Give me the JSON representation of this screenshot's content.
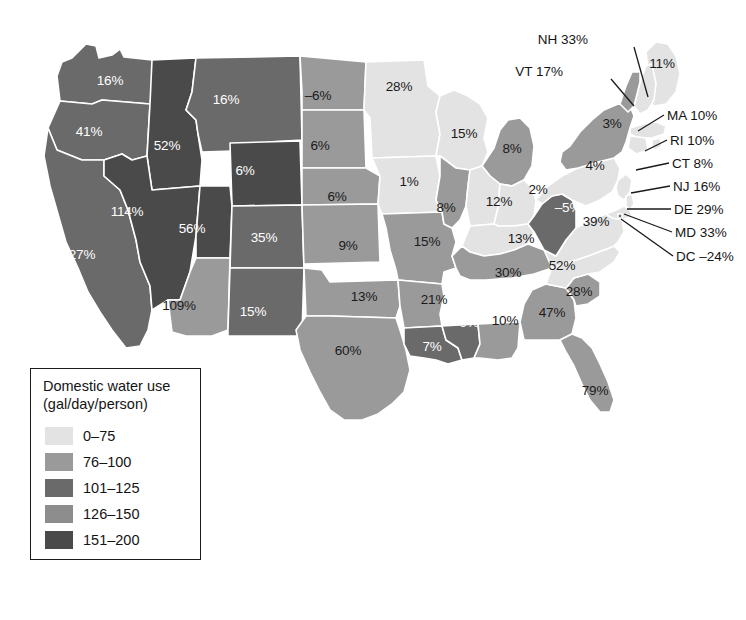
{
  "figure": {
    "type": "choropleth-map",
    "region": "United States (48 contiguous states + DC)",
    "value_suffix": "%"
  },
  "legend": {
    "title_line1": "Domestic water use",
    "title_line2": "(gal/day/person)",
    "classes": [
      {
        "label": "0–75",
        "color": "#e3e3e3"
      },
      {
        "label": "76–100",
        "color": "#9a9a9a"
      },
      {
        "label": "101–125",
        "color": "#6a6a6a"
      },
      {
        "label": "126–150",
        "color": "#8d8d8d"
      },
      {
        "label": "151–200",
        "color": "#4a4a4a"
      }
    ]
  },
  "map": {
    "ocean_color": "#ffffff",
    "border_color": "#ffffff",
    "outline_color": "#b0b0b0",
    "states": [
      {
        "code": "WA",
        "value": "16%",
        "x": 110,
        "y": 80,
        "tone": "light"
      },
      {
        "code": "OR",
        "value": "41%",
        "x": 89,
        "y": 131,
        "tone": "light"
      },
      {
        "code": "CA",
        "value": "27%",
        "x": 82,
        "y": 254,
        "tone": "light"
      },
      {
        "code": "ID",
        "value": "52%",
        "x": 167,
        "y": 145,
        "tone": "light"
      },
      {
        "code": "NV",
        "value": "114%",
        "x": 127,
        "y": 211,
        "tone": "light"
      },
      {
        "code": "MT",
        "value": "16%",
        "x": 226,
        "y": 99,
        "tone": "light"
      },
      {
        "code": "WY",
        "value": "6%",
        "x": 245,
        "y": 170,
        "tone": "light"
      },
      {
        "code": "UT",
        "value": "56%",
        "x": 192,
        "y": 228,
        "tone": "light"
      },
      {
        "code": "CO",
        "value": "35%",
        "x": 264,
        "y": 237,
        "tone": "light"
      },
      {
        "code": "AZ",
        "value": "109%",
        "x": 179,
        "y": 305,
        "tone": "dark"
      },
      {
        "code": "NM",
        "value": "15%",
        "x": 253,
        "y": 311,
        "tone": "light"
      },
      {
        "code": "ND",
        "value": "–6%",
        "x": 318,
        "y": 95,
        "tone": "dark"
      },
      {
        "code": "SD",
        "value": "6%",
        "x": 320,
        "y": 145,
        "tone": "dark"
      },
      {
        "code": "NE",
        "value": "6%",
        "x": 337,
        "y": 196,
        "tone": "dark"
      },
      {
        "code": "KS",
        "value": "9%",
        "x": 348,
        "y": 245,
        "tone": "dark"
      },
      {
        "code": "OK",
        "value": "13%",
        "x": 364,
        "y": 296,
        "tone": "dark"
      },
      {
        "code": "TX",
        "value": "60%",
        "x": 348,
        "y": 350,
        "tone": "dark"
      },
      {
        "code": "MN",
        "value": "28%",
        "x": 399,
        "y": 86,
        "tone": "dark"
      },
      {
        "code": "IA",
        "value": "1%",
        "x": 409,
        "y": 181,
        "tone": "dark"
      },
      {
        "code": "MO",
        "value": "15%",
        "x": 427,
        "y": 241,
        "tone": "dark"
      },
      {
        "code": "AR",
        "value": "21%",
        "x": 434,
        "y": 299,
        "tone": "dark"
      },
      {
        "code": "LA",
        "value": "7%",
        "x": 432,
        "y": 346,
        "tone": "light"
      },
      {
        "code": "WI",
        "value": "15%",
        "x": 464,
        "y": 133,
        "tone": "dark"
      },
      {
        "code": "IL",
        "value": "8%",
        "x": 446,
        "y": 207,
        "tone": "dark"
      },
      {
        "code": "MS",
        "value": "9%",
        "x": 469,
        "y": 322,
        "tone": "light"
      },
      {
        "code": "AL",
        "value": "10%",
        "x": 505,
        "y": 320,
        "tone": "dark"
      },
      {
        "code": "MI",
        "value": "8%",
        "x": 512,
        "y": 148,
        "tone": "dark"
      },
      {
        "code": "IN",
        "value": "12%",
        "x": 499,
        "y": 201,
        "tone": "dark"
      },
      {
        "code": "OH",
        "value": "2%",
        "x": 538,
        "y": 189,
        "tone": "dark"
      },
      {
        "code": "KY",
        "value": "13%",
        "x": 521,
        "y": 238,
        "tone": "dark"
      },
      {
        "code": "TN",
        "value": "30%",
        "x": 508,
        "y": 272,
        "tone": "dark"
      },
      {
        "code": "GA",
        "value": "47%",
        "x": 552,
        "y": 312,
        "tone": "dark"
      },
      {
        "code": "FL",
        "value": "79%",
        "x": 595,
        "y": 390,
        "tone": "dark"
      },
      {
        "code": "SC",
        "value": "28%",
        "x": 579,
        "y": 291,
        "tone": "dark"
      },
      {
        "code": "NC",
        "value": "52%",
        "x": 562,
        "y": 265,
        "tone": "dark"
      },
      {
        "code": "VA",
        "value": "39%",
        "x": 596,
        "y": 221,
        "tone": "dark"
      },
      {
        "code": "WV",
        "value": "–5%",
        "x": 568,
        "y": 207,
        "tone": "light"
      },
      {
        "code": "PA",
        "value": "4%",
        "x": 595,
        "y": 165,
        "tone": "dark"
      },
      {
        "code": "NY",
        "value": "3%",
        "x": 612,
        "y": 123,
        "tone": "dark"
      },
      {
        "code": "ME",
        "value": "11%",
        "x": 662,
        "y": 63,
        "tone": "dark"
      }
    ],
    "callouts": [
      {
        "code": "NH",
        "label": "NH 33%",
        "tx": 588,
        "ty": 39,
        "anchor": "end",
        "lx1": 634,
        "ly1": 47,
        "lx2": 648,
        "ly2": 97
      },
      {
        "code": "VT",
        "label": "VT 17%",
        "tx": 563,
        "ty": 71,
        "anchor": "end",
        "lx1": 611,
        "ly1": 79,
        "lx2": 634,
        "ly2": 106
      },
      {
        "code": "MA",
        "label": "MA 10%",
        "tx": 667,
        "ty": 115,
        "anchor": "start",
        "lx1": 664,
        "ly1": 115,
        "lx2": 638,
        "ly2": 131
      },
      {
        "code": "RI",
        "label": "RI 10%",
        "tx": 670,
        "ty": 140,
        "anchor": "start",
        "lx1": 667,
        "ly1": 140,
        "lx2": 645,
        "ly2": 151
      },
      {
        "code": "CT",
        "label": "CT 8%",
        "tx": 672,
        "ty": 163,
        "anchor": "start",
        "lx1": 669,
        "ly1": 163,
        "lx2": 636,
        "ly2": 170
      },
      {
        "code": "NJ",
        "label": "NJ 16%",
        "tx": 673,
        "ty": 186,
        "anchor": "start",
        "lx1": 670,
        "ly1": 186,
        "lx2": 631,
        "ly2": 193
      },
      {
        "code": "DE",
        "label": "DE 29%",
        "tx": 674,
        "ty": 209,
        "anchor": "start",
        "lx1": 671,
        "ly1": 209,
        "lx2": 627,
        "ly2": 209
      },
      {
        "code": "MD",
        "label": "MD 33%",
        "tx": 675,
        "ty": 232,
        "anchor": "start",
        "lx1": 672,
        "ly1": 232,
        "lx2": 624,
        "ly2": 214
      },
      {
        "code": "DC",
        "label": "DC –24%",
        "tx": 676,
        "ty": 256,
        "anchor": "start",
        "lx1": 673,
        "ly1": 256,
        "lx2": 621,
        "ly2": 219
      }
    ]
  }
}
